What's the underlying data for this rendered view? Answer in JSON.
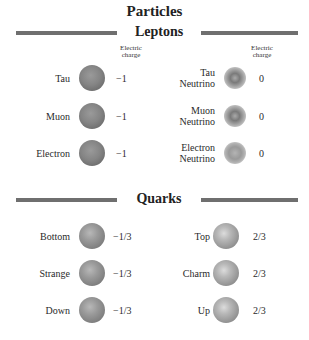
{
  "title": "Particles",
  "sections": {
    "leptons": {
      "heading": "Leptons",
      "charge_header": "Electric charge",
      "charge_header_line1": "Electric",
      "charge_header_line2": "charge",
      "left": [
        {
          "name": "Tau",
          "charge": "−1"
        },
        {
          "name": "Muon",
          "charge": "−1"
        },
        {
          "name": "Electron",
          "charge": "−1"
        }
      ],
      "right": [
        {
          "name": "Tau Neutrino",
          "line1": "Tau",
          "line2": "Neutrino",
          "charge": "0"
        },
        {
          "name": "Muon Neutrino",
          "line1": "Muon",
          "line2": "Neutrino",
          "charge": "0"
        },
        {
          "name": "Electron Neutrino",
          "line1": "Electron",
          "line2": "Neutrino",
          "charge": "0"
        }
      ]
    },
    "quarks": {
      "heading": "Quarks",
      "left": [
        {
          "name": "Bottom",
          "charge": "−1/3"
        },
        {
          "name": "Strange",
          "charge": "−1/3"
        },
        {
          "name": "Down",
          "charge": "−1/3"
        }
      ],
      "right": [
        {
          "name": "Top",
          "charge": "2/3"
        },
        {
          "name": "Charm",
          "charge": "2/3"
        },
        {
          "name": "Up",
          "charge": "2/3"
        }
      ]
    }
  },
  "colors": {
    "rule": "#6f6f6f",
    "text": "#2a2a2a",
    "background": "#ffffff"
  }
}
